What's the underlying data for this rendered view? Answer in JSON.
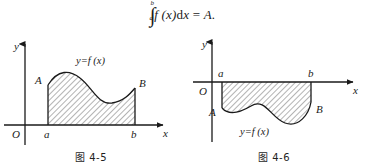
{
  "formula": {
    "integral_symbol": "∫",
    "lower_limit": "a",
    "upper_limit": "b",
    "integrand": "f (x)",
    "differential": "d",
    "variable": "x",
    "equals": "=",
    "result": "A.",
    "full_text": "∫ab f(x) dx = A."
  },
  "figures": [
    {
      "id": "figure-left",
      "caption": "图 4-5",
      "axis_labels": {
        "x": "x",
        "y": "y",
        "origin": "O"
      },
      "point_labels": {
        "left_endpoint": "A",
        "right_endpoint": "B"
      },
      "tick_labels": {
        "lower": "a",
        "upper": "b"
      },
      "curve_label": "y=f (x)",
      "region_position": "above-x-axis",
      "colors": {
        "stroke": "#1a1a1a",
        "hatch": "#555555",
        "fill": "#ffffff"
      }
    },
    {
      "id": "figure-right",
      "caption": "图 4-6",
      "axis_labels": {
        "x": "x",
        "y": "y",
        "origin": "O"
      },
      "point_labels": {
        "left_endpoint": "A",
        "right_endpoint": "B"
      },
      "tick_labels": {
        "lower": "a",
        "upper": "b"
      },
      "curve_label": "y=f (x)",
      "region_position": "below-x-axis",
      "colors": {
        "stroke": "#1a1a1a",
        "hatch": "#555555",
        "fill": "#ffffff"
      }
    }
  ]
}
